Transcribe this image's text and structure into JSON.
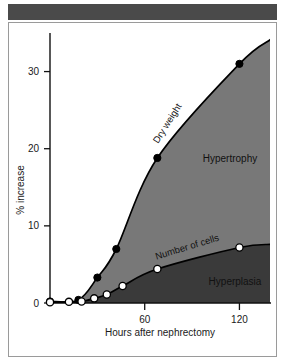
{
  "figure": {
    "background_color": "#ffffff",
    "header_bar_color": "#4a4a4a",
    "frame_border_color": "#9a9a9a"
  },
  "chart_data": {
    "type": "line",
    "title": "",
    "subtitle": "",
    "xlabel": "Hours after nephrectomy",
    "ylabel": "% increase",
    "xlim": [
      0,
      140
    ],
    "ylim": [
      0,
      35
    ],
    "xticks": [
      60,
      120
    ],
    "xtick_labels": [
      "60",
      "120"
    ],
    "yticks": [
      0,
      10,
      20,
      30
    ],
    "ytick_labels": [
      "0",
      "10",
      "20",
      "30"
    ],
    "grid": false,
    "legend": "none",
    "series": [
      {
        "name": "Dry weight",
        "marker": "filled-circle",
        "marker_fill": "#000000",
        "line_color": "#000000",
        "x": [
          0,
          18,
          30,
          42,
          68,
          120,
          140
        ],
        "values": [
          0.2,
          0.4,
          3.3,
          7.0,
          18.8,
          31.0,
          34.2
        ]
      },
      {
        "name": "Number of cells",
        "marker": "open-circle",
        "marker_fill": "#ffffff",
        "line_color": "#000000",
        "x": [
          0,
          12,
          20,
          28,
          36,
          46,
          68,
          120,
          140
        ],
        "values": [
          0.1,
          0.15,
          0.2,
          0.6,
          1.1,
          2.2,
          4.4,
          7.2,
          7.6
        ]
      }
    ],
    "regions": [
      {
        "label": "Hypertrophy",
        "color": "#787878",
        "description": "Area between the Dry weight curve and the Number of cells curve"
      },
      {
        "label": "Hyperplasia",
        "color": "#3a3a3a",
        "description": "Area below the Number of cells curve"
      }
    ],
    "annotations": [
      {
        "text": "Dry weight",
        "rotation": -58,
        "placement": "along-upper-curve"
      },
      {
        "text": "Number of cells",
        "rotation": -17,
        "placement": "along-lower-curve"
      },
      {
        "text": "Hypertrophy",
        "rotation": 0,
        "placement": "upper-region"
      },
      {
        "text": "Hyperplasia",
        "rotation": 0,
        "placement": "lower-region"
      }
    ]
  }
}
